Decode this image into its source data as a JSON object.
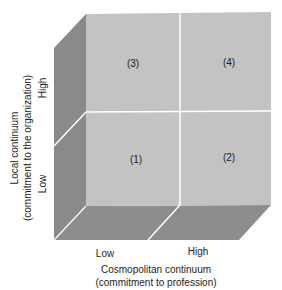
{
  "diagram": {
    "cells": [
      {
        "id": "1",
        "label": "(1)",
        "row": "Low",
        "column": "Low"
      },
      {
        "id": "2",
        "label": "(2)",
        "row": "Low",
        "column": "High"
      },
      {
        "id": "3",
        "label": "(3)",
        "row": "High",
        "column": "Low"
      },
      {
        "id": "4",
        "label": "(4)",
        "row": "High",
        "column": "High"
      }
    ],
    "y_axis": {
      "title": "Local continuum",
      "subtitle": "(commitment to the organization)",
      "ticks": [
        "High",
        "Low"
      ]
    },
    "x_axis": {
      "title": "Cosmopolitan continuum",
      "subtitle": "(commitment to profession)",
      "ticks": [
        "Low",
        "High"
      ]
    },
    "colors": {
      "front_face": "#c3c3c3",
      "side_face": "#8a8a8a",
      "bottom_face": "#8d8d8d",
      "divider": "#ffffff"
    }
  }
}
